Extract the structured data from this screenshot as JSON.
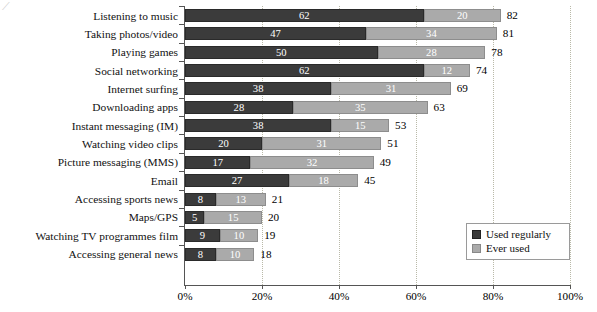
{
  "chart_data": {
    "type": "bar",
    "orientation": "horizontal",
    "stacked": true,
    "title": "",
    "subtitle": "",
    "xlabel": "",
    "ylabel": "",
    "xlim": [
      0,
      100
    ],
    "xticks": [
      0,
      20,
      40,
      60,
      80,
      100
    ],
    "xticklabels": [
      "0%",
      "20%",
      "40%",
      "60%",
      "80%",
      "100%"
    ],
    "grid": "vertical-dotted",
    "legend_position": "inside-bottom-right",
    "categories": [
      "Listening to music",
      "Taking photos/video",
      "Playing games",
      "Social networking",
      "Internet surfing",
      "Downloading apps",
      "Instant messaging (IM)",
      "Watching video clips",
      "Picture messaging (MMS)",
      "Email",
      "Accessing sports news",
      "Maps/GPS",
      "Watching TV programmes film",
      "Accessing general news"
    ],
    "series": [
      {
        "name": "Used regularly",
        "color": "#3b3b3b",
        "values": [
          62,
          47,
          50,
          62,
          38,
          28,
          38,
          20,
          17,
          27,
          8,
          5,
          9,
          8
        ]
      },
      {
        "name": "Ever used",
        "color": "#aaaaaa",
        "values": [
          20,
          34,
          28,
          12,
          31,
          35,
          15,
          31,
          32,
          18,
          13,
          15,
          10,
          10
        ]
      }
    ],
    "totals": [
      82,
      81,
      78,
      74,
      69,
      63,
      53,
      51,
      49,
      45,
      21,
      20,
      19,
      18
    ]
  },
  "legend": {
    "items": [
      {
        "label": "Used regularly",
        "color": "#3b3b3b"
      },
      {
        "label": "Ever used",
        "color": "#aaaaaa"
      }
    ]
  },
  "axis": {
    "x_tick_labels": [
      "0%",
      "20%",
      "40%",
      "60%",
      "80%",
      "100%"
    ]
  }
}
